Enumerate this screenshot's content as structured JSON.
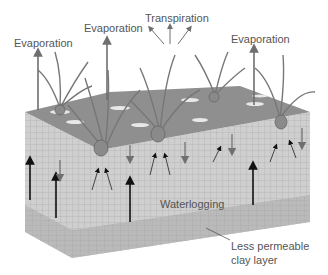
{
  "diagram": {
    "title_labels": {
      "evap_left": "Evaporation",
      "evap_mid": "Evaporation",
      "transpiration": "Transpiration",
      "evap_right": "Evaporation"
    },
    "soil_labels": {
      "waterlogging": "Waterlogging",
      "clay_line1": "Less permeable",
      "clay_line2": "clay layer"
    },
    "colors": {
      "surface": "#8c8c8c",
      "soil": "#c9c9c9",
      "clay": "#b4b4b4",
      "arrow_gray": "#6f6f6f",
      "arrow_black": "#111111",
      "text": "#555555"
    }
  }
}
